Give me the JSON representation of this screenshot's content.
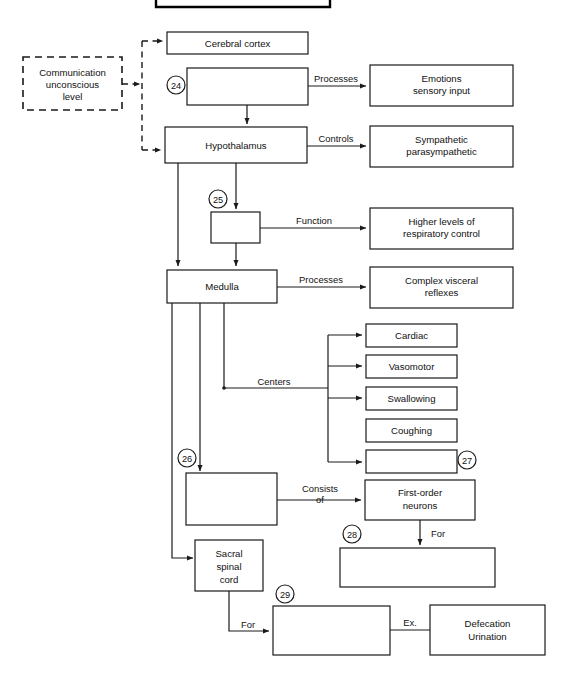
{
  "diagram": {
    "type": "flowchart",
    "colors": {
      "stroke": "#1a1a1a",
      "fill": "#ffffff",
      "text": "#111111"
    },
    "top_bar": {
      "label": ""
    },
    "nodes": [
      {
        "id": "communication",
        "label_lines": [
          "Communication",
          "unconscious",
          "level"
        ],
        "style": "dashed"
      },
      {
        "id": "cerebral-cortex",
        "label_lines": [
          "Cerebral cortex"
        ],
        "style": "solid"
      },
      {
        "id": "blank-24",
        "label_lines": [
          ""
        ],
        "style": "solid",
        "number": "24"
      },
      {
        "id": "emotions",
        "label_lines": [
          "Emotions",
          "sensory input"
        ],
        "style": "solid"
      },
      {
        "id": "hypothalamus",
        "label_lines": [
          "Hypothalamus"
        ],
        "style": "solid"
      },
      {
        "id": "sympathetic",
        "label_lines": [
          "Sympathetic",
          "parasympathetic"
        ],
        "style": "solid"
      },
      {
        "id": "blank-25",
        "label_lines": [
          ""
        ],
        "style": "solid",
        "number": "25"
      },
      {
        "id": "higher-levels",
        "label_lines": [
          "Higher levels of",
          "respiratory control"
        ],
        "style": "solid"
      },
      {
        "id": "medulla",
        "label_lines": [
          "Medulla"
        ],
        "style": "solid"
      },
      {
        "id": "complex-visceral",
        "label_lines": [
          "Complex visceral",
          "reflexes"
        ],
        "style": "solid"
      },
      {
        "id": "cardiac",
        "label_lines": [
          "Cardiac"
        ],
        "style": "solid"
      },
      {
        "id": "vasomotor",
        "label_lines": [
          "Vasomotor"
        ],
        "style": "solid"
      },
      {
        "id": "swallowing",
        "label_lines": [
          "Swallowing"
        ],
        "style": "solid"
      },
      {
        "id": "coughing",
        "label_lines": [
          "Coughing"
        ],
        "style": "solid"
      },
      {
        "id": "blank-27",
        "label_lines": [
          ""
        ],
        "style": "solid",
        "number": "27"
      },
      {
        "id": "blank-26",
        "label_lines": [
          ""
        ],
        "style": "solid",
        "number": "26"
      },
      {
        "id": "first-order-neurons",
        "label_lines": [
          "First-order",
          "neurons"
        ],
        "style": "solid"
      },
      {
        "id": "blank-28",
        "label_lines": [
          ""
        ],
        "style": "solid",
        "number": "28"
      },
      {
        "id": "sacral-spinal-cord",
        "label_lines": [
          "Sacral",
          "spinal",
          "cord"
        ],
        "style": "solid"
      },
      {
        "id": "blank-29",
        "label_lines": [
          ""
        ],
        "style": "solid",
        "number": "29"
      },
      {
        "id": "defecation-urination",
        "label_lines": [
          "Defecation",
          "Urination"
        ],
        "style": "solid"
      }
    ],
    "edge_labels": [
      {
        "id": "processes-1",
        "text": "Processes"
      },
      {
        "id": "controls",
        "text": "Controls"
      },
      {
        "id": "function",
        "text": "Function"
      },
      {
        "id": "processes-2",
        "text": "Processes"
      },
      {
        "id": "centers",
        "text": "Centers"
      },
      {
        "id": "consists",
        "text": "Consists"
      },
      {
        "id": "consists-of",
        "text": "of"
      },
      {
        "id": "for-1",
        "text": "For"
      },
      {
        "id": "for-2",
        "text": "For"
      },
      {
        "id": "ex",
        "text": "Ex."
      }
    ],
    "numbers": [
      "24",
      "25",
      "26",
      "27",
      "28",
      "29"
    ],
    "text": {
      "communication_l1": "Communication",
      "communication_l2": "unconscious",
      "communication_l3": "level",
      "cerebral_cortex": "Cerebral cortex",
      "emotions_l1": "Emotions",
      "emotions_l2": "sensory input",
      "hypothalamus": "Hypothalamus",
      "sympathetic_l1": "Sympathetic",
      "sympathetic_l2": "parasympathetic",
      "higher_l1": "Higher levels of",
      "higher_l2": "respiratory control",
      "medulla": "Medulla",
      "visceral_l1": "Complex visceral",
      "visceral_l2": "reflexes",
      "cardiac": "Cardiac",
      "vasomotor": "Vasomotor",
      "swallowing": "Swallowing",
      "coughing": "Coughing",
      "first_order_l1": "First-order",
      "first_order_l2": "neurons",
      "sacral_l1": "Sacral",
      "sacral_l2": "spinal",
      "sacral_l3": "cord",
      "defecation_l1": "Defecation",
      "defecation_l2": "Urination",
      "lbl_processes_1": "Processes",
      "lbl_controls": "Controls",
      "lbl_function": "Function",
      "lbl_processes_2": "Processes",
      "lbl_centers": "Centers",
      "lbl_consists": "Consists",
      "lbl_of": "of",
      "lbl_for_1": "For",
      "lbl_for_2": "For",
      "lbl_ex": "Ex.",
      "num_24": "24",
      "num_25": "25",
      "num_26": "26",
      "num_27": "27",
      "num_28": "28",
      "num_29": "29"
    }
  }
}
